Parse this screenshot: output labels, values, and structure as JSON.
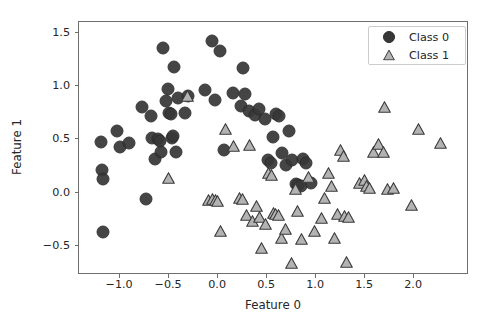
{
  "chart_data": {
    "type": "scatter",
    "title": "",
    "xlabel": "Feature 0",
    "ylabel": "Feature 1",
    "xlim": [
      -1.42,
      2.56
    ],
    "ylim": [
      -0.77,
      1.6
    ],
    "xticks": [
      -1.0,
      -0.5,
      0.0,
      0.5,
      1.0,
      1.5,
      2.0
    ],
    "xticklabels": [
      "−1.0",
      "−0.5",
      "0.0",
      "0.5",
      "1.0",
      "1.5",
      "2.0"
    ],
    "yticks": [
      -0.5,
      0.0,
      0.5,
      1.0,
      1.5
    ],
    "yticklabels": [
      "−0.5",
      "0.0",
      "0.5",
      "1.0",
      "1.5"
    ],
    "grid": false,
    "legend_position": "upper right",
    "series": [
      {
        "name": "Class 0",
        "marker": "circle",
        "color": "#383838",
        "edge_color": "#2b2b2b",
        "points": [
          [
            -1.19,
            0.47
          ],
          [
            -1.17,
            0.2
          ],
          [
            -1.16,
            0.12
          ],
          [
            -1.16,
            -0.38
          ],
          [
            -1.02,
            0.57
          ],
          [
            -0.99,
            0.42
          ],
          [
            -0.9,
            0.46
          ],
          [
            -0.77,
            0.79
          ],
          [
            -0.73,
            -0.07
          ],
          [
            -0.68,
            0.71
          ],
          [
            -0.66,
            0.5
          ],
          [
            -0.63,
            0.31
          ],
          [
            -0.6,
            0.49
          ],
          [
            -0.58,
            0.48
          ],
          [
            -0.57,
            0.37
          ],
          [
            -0.55,
            1.35
          ],
          [
            -0.52,
            0.85
          ],
          [
            -0.5,
            0.96
          ],
          [
            -0.49,
            0.74
          ],
          [
            -0.47,
            0.73
          ],
          [
            -0.46,
            0.5
          ],
          [
            -0.45,
            0.52
          ],
          [
            -0.44,
            1.17
          ],
          [
            -0.42,
            0.37
          ],
          [
            -0.4,
            0.88
          ],
          [
            -0.33,
            0.74
          ],
          [
            -0.3,
            0.9
          ],
          [
            -0.12,
            0.95
          ],
          [
            -0.05,
            1.41
          ],
          [
            -0.02,
            0.86
          ],
          [
            0.03,
            1.32
          ],
          [
            0.07,
            0.39
          ],
          [
            0.16,
            0.93
          ],
          [
            0.24,
            0.8
          ],
          [
            0.26,
            1.16
          ],
          [
            0.28,
            0.92
          ],
          [
            0.33,
            0.76
          ],
          [
            0.39,
            0.72
          ],
          [
            0.43,
            0.78
          ],
          [
            0.49,
            0.68
          ],
          [
            0.52,
            0.3
          ],
          [
            0.55,
            0.27
          ],
          [
            0.57,
            0.51
          ],
          [
            0.6,
            0.73
          ],
          [
            0.63,
            0.71
          ],
          [
            0.66,
            0.36
          ],
          [
            0.7,
            0.25
          ],
          [
            0.73,
            0.57
          ],
          [
            0.76,
            0.3
          ],
          [
            0.8,
            0.07
          ],
          [
            0.83,
            0.06
          ],
          [
            0.86,
            0.05
          ],
          [
            0.88,
            0.31
          ],
          [
            0.91,
            0.27
          ],
          [
            0.96,
            0.08
          ]
        ]
      },
      {
        "name": "Class 1",
        "marker": "triangle",
        "color": "#b3b3b3",
        "edge_color": "#3a3a3a",
        "points": [
          [
            -0.5,
            0.13
          ],
          [
            -0.3,
            0.9
          ],
          [
            -0.09,
            -0.08
          ],
          [
            -0.05,
            -0.07
          ],
          [
            -0.02,
            -0.08
          ],
          [
            0.0,
            -0.09
          ],
          [
            0.03,
            -0.37
          ],
          [
            0.09,
            0.59
          ],
          [
            0.17,
            0.43
          ],
          [
            0.23,
            -0.06
          ],
          [
            0.26,
            -0.07
          ],
          [
            0.3,
            -0.22
          ],
          [
            0.33,
            0.44
          ],
          [
            0.36,
            -0.27
          ],
          [
            0.4,
            -0.13
          ],
          [
            0.43,
            -0.24
          ],
          [
            0.45,
            -0.53
          ],
          [
            0.49,
            -0.3
          ],
          [
            0.52,
            0.18
          ],
          [
            0.55,
            0.16
          ],
          [
            0.57,
            -0.2
          ],
          [
            0.6,
            -0.21
          ],
          [
            0.63,
            -0.22
          ],
          [
            0.66,
            -0.43
          ],
          [
            0.7,
            -0.35
          ],
          [
            0.76,
            -0.67
          ],
          [
            0.8,
            0.03
          ],
          [
            0.82,
            -0.18
          ],
          [
            0.86,
            -0.44
          ],
          [
            0.93,
            0.14
          ],
          [
            0.99,
            -0.37
          ],
          [
            1.06,
            -0.25
          ],
          [
            1.1,
            -0.06
          ],
          [
            1.14,
            0.18
          ],
          [
            1.17,
            0.05
          ],
          [
            1.2,
            -0.43
          ],
          [
            1.23,
            -0.21
          ],
          [
            1.26,
            0.39
          ],
          [
            1.29,
            0.34
          ],
          [
            1.3,
            -0.23
          ],
          [
            1.32,
            -0.66
          ],
          [
            1.34,
            -0.24
          ],
          [
            1.45,
            0.08
          ],
          [
            1.5,
            0.11
          ],
          [
            1.52,
            0.05
          ],
          [
            1.55,
            0.04
          ],
          [
            1.6,
            0.37
          ],
          [
            1.65,
            0.45
          ],
          [
            1.7,
            0.37
          ],
          [
            1.71,
            0.79
          ],
          [
            1.74,
            0.03
          ],
          [
            1.8,
            0.04
          ],
          [
            1.98,
            -0.12
          ],
          [
            2.05,
            0.59
          ],
          [
            2.28,
            0.46
          ]
        ]
      }
    ]
  },
  "legend": {
    "entries": [
      {
        "label": "Class 0",
        "glyph": "circle-marker"
      },
      {
        "label": "Class 1",
        "glyph": "triangle-marker"
      }
    ]
  }
}
